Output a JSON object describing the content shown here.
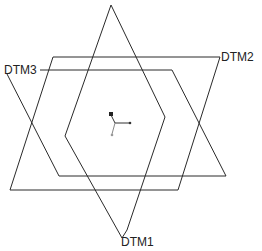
{
  "diagram": {
    "type": "datum-planes",
    "labels": {
      "dtm1": "DTM1",
      "dtm2": "DTM2",
      "dtm3": "DTM3"
    },
    "colors": {
      "stroke": "#2a2a2a",
      "background": "#ffffff",
      "csys_marker": "#222222",
      "csys_gray": "#999999"
    }
  }
}
